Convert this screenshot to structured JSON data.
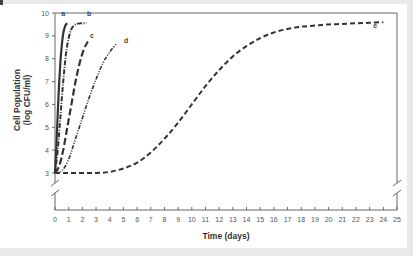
{
  "chart_data": {
    "type": "line",
    "title": "",
    "xlabel": "Time (days)",
    "ylabel_lines": [
      "Cell Population",
      "(log CFU/ml)"
    ],
    "xlim": [
      0,
      25
    ],
    "ylim": [
      3,
      10
    ],
    "y_axis_break": true,
    "x_axis_break": true,
    "grid": false,
    "legend": "none (curves labeled inline)",
    "xticks": [
      0,
      1,
      2,
      3,
      4,
      5,
      6,
      7,
      8,
      9,
      10,
      11,
      12,
      13,
      14,
      15,
      16,
      17,
      18,
      19,
      20,
      21,
      22,
      23,
      24,
      25
    ],
    "yticks": [
      3,
      4,
      5,
      6,
      7,
      8,
      9,
      10
    ],
    "series": [
      {
        "name": "a",
        "style": "solid",
        "x": [
          0,
          0.1,
          0.2,
          0.3,
          0.4,
          0.5,
          0.6,
          0.7,
          0.8,
          0.9
        ],
        "y": [
          3.0,
          4.2,
          5.6,
          6.9,
          7.9,
          8.6,
          9.1,
          9.35,
          9.5,
          9.55
        ]
      },
      {
        "name": "b",
        "style": "dash-dot",
        "x": [
          0,
          0.2,
          0.4,
          0.6,
          0.8,
          1.0,
          1.2,
          1.5,
          1.9,
          2.3
        ],
        "y": [
          3.0,
          4.0,
          5.5,
          7.0,
          8.2,
          8.9,
          9.3,
          9.5,
          9.55,
          9.55
        ]
      },
      {
        "name": "c",
        "style": "long-dash",
        "x": [
          0,
          0.3,
          0.6,
          0.9,
          1.2,
          1.5,
          1.8,
          2.1,
          2.4
        ],
        "y": [
          3.0,
          3.3,
          4.0,
          5.0,
          6.0,
          7.0,
          7.8,
          8.4,
          8.75
        ]
      },
      {
        "name": "d",
        "style": "dash-dot-dot",
        "x": [
          0,
          0.5,
          1.0,
          1.5,
          2.0,
          2.5,
          3.0,
          3.5,
          4.0,
          4.5
        ],
        "y": [
          3.0,
          3.1,
          3.6,
          4.5,
          5.4,
          6.3,
          7.1,
          7.8,
          8.3,
          8.65
        ]
      },
      {
        "name": "e",
        "style": "dash",
        "x": [
          0,
          1,
          2,
          3,
          4,
          5,
          6,
          7,
          8,
          9,
          10,
          11,
          12,
          13,
          14,
          15,
          16,
          17,
          18,
          19,
          20,
          21,
          22,
          23,
          24
        ],
        "y": [
          3.0,
          3.0,
          3.0,
          3.0,
          3.05,
          3.2,
          3.45,
          3.9,
          4.5,
          5.2,
          6.0,
          6.8,
          7.5,
          8.1,
          8.55,
          8.9,
          9.15,
          9.3,
          9.4,
          9.45,
          9.5,
          9.52,
          9.55,
          9.57,
          9.6
        ]
      }
    ],
    "annotations": [
      {
        "text": "a",
        "x": 0.6,
        "y": 9.85
      },
      {
        "text": "b",
        "x": 2.5,
        "y": 9.85
      },
      {
        "text": "c",
        "x": 2.7,
        "y": 8.9
      },
      {
        "text": "d",
        "x": 5.2,
        "y": 8.7
      },
      {
        "text": "e",
        "x": 23.4,
        "y": 9.35
      }
    ]
  }
}
